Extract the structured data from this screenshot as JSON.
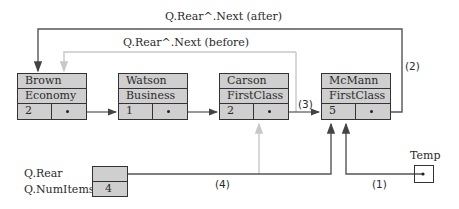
{
  "labels": {
    "after": "Q.Rear^.Next    (after)",
    "before": "Q.Rear^.Next    (before)",
    "step1": "(1)",
    "step2": "(2)",
    "step3": "(3)",
    "step4": "(4)",
    "q_rear": "Q.Rear",
    "q_numitems": "Q.NumItems",
    "temp": "Temp"
  },
  "queue_record": {
    "num_items": "4"
  },
  "nodes": [
    {
      "name": "Brown",
      "class": "Economy",
      "count": "2"
    },
    {
      "name": "Watson",
      "class": "Business",
      "count": "1"
    },
    {
      "name": "Carson",
      "class": "FirstClass",
      "count": "2"
    },
    {
      "name": "McMann",
      "class": "FirstClass",
      "count": "5"
    }
  ],
  "colors": {
    "node_fill": "#cfcfcf",
    "line_dark": "#555555",
    "line_light": "#c8c8c8"
  }
}
